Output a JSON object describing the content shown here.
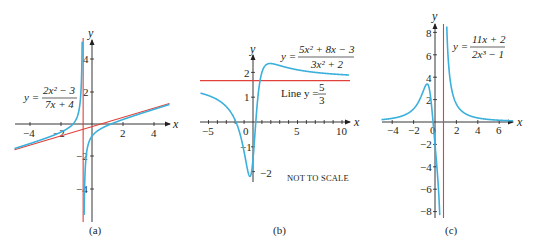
{
  "colors": {
    "curve": "#3bb0dc",
    "asymptote": "#e0413a",
    "axis": "#231f20"
  },
  "chart_data": [
    {
      "type": "line",
      "panel": "a",
      "caption": "(a)",
      "title": "",
      "equation": {
        "lhs": "y =",
        "numerator": "2x² − 3",
        "denominator": "7x + 4"
      },
      "xlabel": "x",
      "ylabel": "y",
      "xlim": [
        -5,
        5
      ],
      "ylim": [
        -6,
        5.5
      ],
      "xticks": [
        -4,
        -2,
        2,
        4
      ],
      "yticks": [
        4,
        2,
        -2,
        -4
      ],
      "xtick_labels": [
        "−4",
        "−2",
        "2",
        "4"
      ],
      "ytick_labels": [
        "4",
        "2",
        "−2",
        "−4"
      ],
      "grid": false,
      "series": [
        {
          "name": "y = (2x² − 3)/(7x + 4)",
          "kind": "rational",
          "num": [
            2,
            0,
            -3
          ],
          "den": [
            7,
            4
          ],
          "color": "curve"
        },
        {
          "name": "Vertical asymptote x = −4/7",
          "kind": "vline",
          "x": -0.5714,
          "color": "asymptote"
        },
        {
          "name": "Oblique asymptote y = (2/7)x − 8/49",
          "kind": "line",
          "slope": 0.2857,
          "intercept": -0.1633,
          "color": "asymptote"
        }
      ],
      "frame": {
        "ox": 92,
        "oy": 124,
        "sx": 15.5,
        "sy": 16.2,
        "xaxis": [
          15,
          170
        ],
        "yaxis": [
          222,
          40
        ]
      }
    },
    {
      "type": "line",
      "panel": "b",
      "caption": "(b)",
      "title": "",
      "equation": {
        "lhs": "y =",
        "numerator": "5x² + 8x − 3",
        "denominator": "3x² + 2"
      },
      "annotation_line": {
        "text": "Line y =",
        "numerator": "5",
        "denominator": "3"
      },
      "note": "NOT TO SCALE",
      "xlabel": "x",
      "ylabel": "y",
      "xlim": [
        -5.5,
        10.5
      ],
      "ylim": [
        -2.3,
        2.5
      ],
      "xticks": [
        -5,
        0,
        5,
        10
      ],
      "yticks": [
        2,
        1,
        -1,
        -2
      ],
      "xtick_labels": [
        "−5",
        "0",
        "5",
        "10"
      ],
      "ytick_labels": [
        "2",
        "1",
        "−1",
        "−2"
      ],
      "grid": false,
      "series": [
        {
          "name": "y = (5x² + 8x − 3)/(3x² + 2)",
          "kind": "rational",
          "num": [
            5,
            8,
            -3
          ],
          "den": [
            3,
            0,
            2
          ],
          "color": "curve"
        },
        {
          "name": "Horizontal asymptote y = 5/3",
          "kind": "hline",
          "y": 1.6667,
          "color": "asymptote"
        }
      ],
      "frame": {
        "ox": 253,
        "oy": 122,
        "sx": 8.9,
        "sy": 24.8,
        "xaxis": [
          200,
          350
        ],
        "yaxis": [
          182,
          55
        ]
      }
    },
    {
      "type": "line",
      "panel": "c",
      "caption": "(c)",
      "title": "",
      "equation": {
        "lhs": "y =",
        "numerator": "11x + 2",
        "denominator": "2x³ − 1"
      },
      "xlabel": "x",
      "ylabel": "y",
      "xlim": [
        -4,
        7
      ],
      "ylim": [
        -8.5,
        8.5
      ],
      "xticks": [
        -4,
        -2,
        0,
        2,
        4,
        6
      ],
      "yticks": [
        8,
        6,
        4,
        2,
        -2,
        -4,
        -6,
        -8
      ],
      "xtick_labels": [
        "−4",
        "−2",
        "0",
        "2",
        "4",
        "6"
      ],
      "ytick_labels": [
        "8",
        "6",
        "4",
        "2",
        "−2",
        "−4",
        "−6",
        "−8"
      ],
      "grid": false,
      "series": [
        {
          "name": "y = (11x + 2)/(2x³ − 1)",
          "kind": "rational",
          "num": [
            11,
            2
          ],
          "den": [
            2,
            0,
            0,
            -1
          ],
          "color": "curve"
        },
        {
          "name": "Vertical asymptote x = (1/2)^(1/3)",
          "kind": "vline",
          "x": 0.7937,
          "color": "asymptote"
        }
      ],
      "frame": {
        "ox": 435,
        "oy": 122,
        "sx": 10.7,
        "sy": 11.2,
        "xaxis": [
          382,
          513
        ],
        "yaxis": [
          218,
          24
        ]
      }
    }
  ]
}
